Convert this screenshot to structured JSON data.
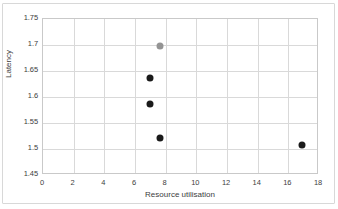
{
  "chart_data": {
    "type": "scatter",
    "title": "",
    "xlabel": "Resource utilisation",
    "ylabel": "Latency",
    "xlim": [
      0,
      18
    ],
    "ylim": [
      1.45,
      1.75
    ],
    "xticks": [
      "0",
      "2",
      "4",
      "6",
      "8",
      "10",
      "12",
      "14",
      "16",
      "18"
    ],
    "yticks": [
      "1.45",
      "1.5",
      "1.55",
      "1.6",
      "1.65",
      "1.7",
      "1.75"
    ],
    "grid": true,
    "legend": "none",
    "series": [
      {
        "name": "highlighted-point",
        "color": "#949494",
        "points": [
          {
            "x": 7.6,
            "y": 1.699
          }
        ]
      },
      {
        "name": "measurements",
        "color": "#1a1a1a",
        "points": [
          {
            "x": 7.0,
            "y": 1.637
          },
          {
            "x": 7.0,
            "y": 1.587
          },
          {
            "x": 7.6,
            "y": 1.522
          },
          {
            "x": 16.9,
            "y": 1.508
          }
        ]
      }
    ]
  },
  "axes": {
    "x_title": "Resource utilisation",
    "y_title": "Latency",
    "x_ticks": [
      {
        "label": "0",
        "value": 0
      },
      {
        "label": "2",
        "value": 2
      },
      {
        "label": "4",
        "value": 4
      },
      {
        "label": "6",
        "value": 6
      },
      {
        "label": "8",
        "value": 8
      },
      {
        "label": "10",
        "value": 10
      },
      {
        "label": "12",
        "value": 12
      },
      {
        "label": "14",
        "value": 14
      },
      {
        "label": "16",
        "value": 16
      },
      {
        "label": "18",
        "value": 18
      }
    ],
    "y_ticks": [
      {
        "label": "1.75",
        "value": 1.75
      },
      {
        "label": "1.7",
        "value": 1.7
      },
      {
        "label": "1.65",
        "value": 1.65
      },
      {
        "label": "1.6",
        "value": 1.6
      },
      {
        "label": "1.55",
        "value": 1.55
      },
      {
        "label": "1.5",
        "value": 1.5
      },
      {
        "label": "1.45",
        "value": 1.45
      }
    ]
  },
  "colors": {
    "point_dark": "#1a1a1a",
    "point_gray": "#949494",
    "gridline": "#d9d9d9",
    "axis_line": "#c9c9c9",
    "frame": "#d8d8d8",
    "text": "#3d3d3d"
  }
}
